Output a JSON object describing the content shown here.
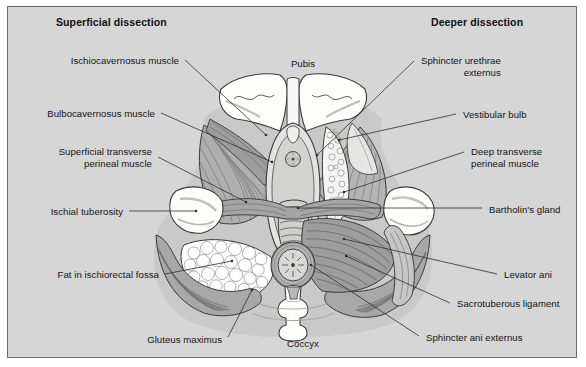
{
  "figure": {
    "background_color": "#d6d6d6",
    "border_color": "#6d6d6d",
    "page_background": "#ffffff"
  },
  "headers": {
    "left": "Superficial dissection",
    "right": "Deeper dissection"
  },
  "center_labels": [
    {
      "id": "pubis",
      "text": "Pubis",
      "x": 295,
      "y": 51
    },
    {
      "id": "coccyx",
      "text": "Coccyx",
      "x": 295,
      "y": 331
    }
  ],
  "left_labels": [
    {
      "id": "ischiocavernosus-muscle",
      "text": "Ischiocavernosus muscle",
      "right": 173,
      "top": 48
    },
    {
      "id": "bulbocavernosus-muscle",
      "text": "Bulbocavernosus muscle",
      "right": 149,
      "top": 101
    },
    {
      "id": "superficial-transverse-perineal-muscle",
      "text": "Superficial transverse\nperineal muscle",
      "right": 146,
      "top": 139
    },
    {
      "id": "ischial-tuberosity",
      "text": "Ischial tuberosity",
      "right": 117,
      "top": 199
    },
    {
      "id": "fat-in-ischiorectal-fossa",
      "text": "Fat in ischiorectal fossa",
      "right": 153,
      "top": 262
    },
    {
      "id": "gluteus-maximus",
      "text": "Gluteus maximus",
      "right": 216,
      "top": 327
    }
  ],
  "right_labels": [
    {
      "id": "sphincter-urethrae-externus",
      "text": "Sphincter urethrae\nexternus",
      "left": 413,
      "top": 48,
      "align": "right"
    },
    {
      "id": "vestibular-bulb",
      "text": "Vestibular bulb",
      "left": 455,
      "top": 102,
      "align": "left"
    },
    {
      "id": "deep-transverse-perineal-muscle",
      "text": "Deep transverse\nperineal muscle",
      "left": 463,
      "top": 139,
      "align": "left"
    },
    {
      "id": "bartholins-gland",
      "text": "Bartholin's gland",
      "left": 481,
      "top": 197,
      "align": "left"
    },
    {
      "id": "levator-ani",
      "text": "Levator ani",
      "left": 496,
      "top": 262,
      "align": "left"
    },
    {
      "id": "sacrotuberous-ligament",
      "text": "Sacrotuberous ligament",
      "left": 449,
      "top": 291,
      "align": "left"
    },
    {
      "id": "sphincter-ani-externus",
      "text": "Sphincter ani externus",
      "left": 418,
      "top": 325,
      "align": "left"
    }
  ],
  "leader_lines": [
    {
      "from": "ischiocavernosus-muscle",
      "x1": 177,
      "y1": 53,
      "x2": 258,
      "y2": 128
    },
    {
      "from": "bulbocavernosus-muscle",
      "x1": 153,
      "y1": 106,
      "x2": 264,
      "y2": 155
    },
    {
      "from": "superficial-transverse-perineal-muscle",
      "x1": 150,
      "y1": 150,
      "x2": 238,
      "y2": 195
    },
    {
      "from": "ischial-tuberosity",
      "x1": 121,
      "y1": 204,
      "x2": 188,
      "y2": 204
    },
    {
      "from": "fat-in-ischiorectal-fossa",
      "x1": 157,
      "y1": 267,
      "x2": 224,
      "y2": 254
    },
    {
      "from": "gluteus-maximus",
      "x1": 220,
      "y1": 330,
      "x2": 244,
      "y2": 283
    },
    {
      "from": "sphincter-urethrae-externus",
      "x1": 406,
      "y1": 54,
      "x2": 309,
      "y2": 148
    },
    {
      "from": "vestibular-bulb",
      "x1": 448,
      "y1": 107,
      "x2": 331,
      "y2": 133
    },
    {
      "from": "deep-transverse-perineal-muscle",
      "x1": 456,
      "y1": 145,
      "x2": 336,
      "y2": 185
    },
    {
      "from": "bartholins-gland",
      "x1": 474,
      "y1": 201,
      "x2": 290,
      "y2": 201
    },
    {
      "from": "levator-ani",
      "x1": 489,
      "y1": 267,
      "x2": 336,
      "y2": 232
    },
    {
      "from": "sacrotuberous-ligament",
      "x1": 442,
      "y1": 296,
      "x2": 338,
      "y2": 249
    },
    {
      "from": "sphincter-ani-externus",
      "x1": 411,
      "y1": 329,
      "x2": 303,
      "y2": 258
    }
  ],
  "illustration": {
    "colors": {
      "bone": "#fdfdfb",
      "muscle_light": "#c3c3c3",
      "muscle_mid": "#a9a9a9",
      "muscle_dark": "#8e8e8e",
      "fat": "#ffffff",
      "outline": "#3a3a3a",
      "skin": "#e7e7e4"
    },
    "structures": [
      "pubic bone (left and right rami)",
      "ischiocavernosus muscle",
      "bulbocavernosus muscle",
      "superficial transverse perineal muscle",
      "deep transverse perineal muscle",
      "sphincter urethrae externus",
      "vestibular bulb",
      "Bartholin's gland",
      "ischial tuberosity",
      "fat in ischiorectal fossa",
      "levator ani",
      "gluteus maximus",
      "sacrotuberous ligament",
      "sphincter ani externus",
      "anus",
      "coccyx",
      "vaginal opening",
      "urethral opening"
    ]
  }
}
